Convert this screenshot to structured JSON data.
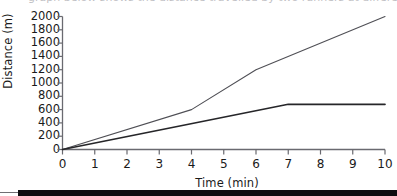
{
  "top_caption": {
    "text": "graph below shows the distance travelled by two runners at different moving rates"
  },
  "chart_data": {
    "type": "line",
    "title": "",
    "xlabel": "Time (min)",
    "ylabel": "Distance (m)",
    "xlim": [
      0,
      10
    ],
    "ylim": [
      0,
      2000
    ],
    "grid": false,
    "legend": "none",
    "x_ticks": [
      "0",
      "1",
      "2",
      "3",
      "4",
      "5",
      "6",
      "7",
      "8",
      "9",
      "10"
    ],
    "y_ticks": [
      "0",
      "200",
      "400",
      "600",
      "800",
      "1000",
      "1200",
      "1400",
      "1600",
      "1800",
      "2000"
    ],
    "series": [
      {
        "name": "faster-runner",
        "color": "#4f4f55",
        "width": 1.1,
        "x": [
          0,
          4,
          6,
          10
        ],
        "values": [
          0,
          600,
          1200,
          2000
        ]
      },
      {
        "name": "slower-runner",
        "color": "#262629",
        "width": 1.7,
        "x": [
          0,
          7,
          10
        ],
        "values": [
          0,
          680,
          680
        ]
      }
    ]
  },
  "axis_style": {
    "axis_color": "#6a6a70",
    "tick_length": 5
  }
}
